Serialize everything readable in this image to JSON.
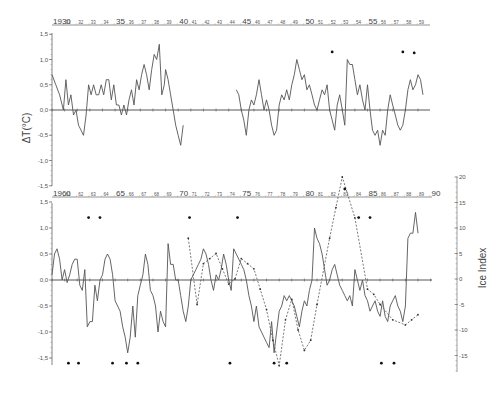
{
  "chart_data": [
    {
      "type": "line",
      "panel": "top",
      "title": "",
      "ylabel": "ΔT(°C)",
      "xlabel": "",
      "xlim": [
        1930,
        1959.9
      ],
      "ylim": [
        -1.5,
        1.5
      ],
      "yticks": [
        1.5,
        1.0,
        0.5,
        0.0,
        -0.5,
        -1.0,
        -1.5
      ],
      "ytick_labels": [
        "1,5",
        "1,0",
        "0,5",
        "0,0",
        "-0,5",
        "-1,0",
        "-1,5"
      ],
      "xtick_labels": [
        "1930",
        "31",
        "32",
        "33",
        "34",
        "35",
        "36",
        "37",
        "38",
        "39",
        "40",
        "41",
        "42",
        "43",
        "44",
        "45",
        "46",
        "47",
        "48",
        "49",
        "50",
        "51",
        "52",
        "53",
        "54",
        "55",
        "56",
        "57",
        "58",
        "59"
      ],
      "grid": false,
      "series": [
        {
          "name": "ΔT temperature anomaly",
          "style": "solid",
          "x": [
            1930.0,
            1930.3,
            1930.6,
            1930.9,
            1931.1,
            1931.3,
            1931.5,
            1931.7,
            1931.9,
            1932.1,
            1932.3,
            1932.5,
            1932.7,
            1932.9,
            1933.1,
            1933.3,
            1933.5,
            1933.7,
            1933.9,
            1934.1,
            1934.3,
            1934.5,
            1934.7,
            1934.9,
            1935.1,
            1935.3,
            1935.5,
            1935.7,
            1935.9,
            1936.1,
            1936.3,
            1936.5,
            1936.7,
            1936.9,
            1937.1,
            1937.3,
            1937.5,
            1937.7,
            1937.9,
            1938.1,
            1938.3,
            1938.5,
            1938.7,
            1938.9,
            1939.0,
            1939.2,
            1939.4,
            1939.6,
            1939.8,
            1940.0,
            1940.2,
            1940.4
          ],
          "y": [
            0.7,
            0.5,
            0.3,
            0.0,
            0.6,
            0.1,
            0.3,
            -0.1,
            0.0,
            -0.3,
            -0.4,
            -0.5,
            -0.1,
            0.5,
            0.3,
            0.5,
            0.3,
            0.3,
            0.5,
            0.3,
            0.6,
            0.6,
            0.2,
            0.5,
            0.1,
            0.1,
            -0.1,
            0.1,
            -0.1,
            0.2,
            0.4,
            0.1,
            0.6,
            0.4,
            0.7,
            0.9,
            0.7,
            0.4,
            0.8,
            1.1,
            1.0,
            1.3,
            0.3,
            0.5,
            0.8,
            0.6,
            0.3,
            0.0,
            -0.3,
            -0.5,
            -0.7,
            -0.3
          ]
        },
        {
          "name": "ΔT temperature anomaly (cont.)",
          "style": "solid",
          "x": [
            1944.6,
            1944.8,
            1945.0,
            1945.2,
            1945.4,
            1945.6,
            1945.8,
            1946.0,
            1946.2,
            1946.4,
            1946.6,
            1946.8,
            1947.0,
            1947.2,
            1947.4,
            1947.6,
            1947.8,
            1948.0,
            1948.2,
            1948.4,
            1948.6,
            1948.8,
            1949.0,
            1949.2,
            1949.4,
            1949.6,
            1949.8,
            1950.0,
            1950.2,
            1950.4,
            1950.6,
            1950.8,
            1951.0,
            1951.2,
            1951.4,
            1951.6,
            1951.8,
            1952.0,
            1952.2,
            1952.4,
            1952.6,
            1952.8,
            1953.0,
            1953.2,
            1953.4,
            1953.6,
            1953.8,
            1954.0,
            1954.2,
            1954.4,
            1954.6,
            1954.8,
            1955.0,
            1955.2,
            1955.4,
            1955.6,
            1955.8,
            1956.0,
            1956.2,
            1956.4,
            1956.6,
            1956.8,
            1957.0,
            1957.2,
            1957.4,
            1957.6,
            1957.8,
            1958.0,
            1958.2,
            1958.4,
            1958.6,
            1958.8,
            1959.0,
            1959.2,
            1959.4
          ],
          "y": [
            0.4,
            0.3,
            0.0,
            -0.2,
            -0.5,
            0.0,
            0.2,
            0.1,
            0.3,
            0.6,
            0.3,
            0.0,
            0.2,
            0.0,
            -0.3,
            -0.5,
            -0.4,
            0.1,
            0.3,
            0.2,
            0.4,
            0.2,
            0.5,
            0.7,
            1.0,
            0.8,
            0.6,
            0.7,
            0.4,
            0.5,
            0.3,
            0.1,
            0.0,
            0.2,
            0.4,
            0.3,
            0.5,
            0.0,
            -0.2,
            -0.4,
            0.1,
            0.3,
            0.0,
            -0.3,
            1.0,
            0.9,
            0.9,
            0.6,
            0.3,
            0.5,
            0.2,
            0.0,
            0.5,
            0.0,
            -0.4,
            -0.5,
            -0.4,
            -0.7,
            -0.4,
            -0.5,
            0.0,
            0.3,
            0.1,
            -0.1,
            -0.3,
            -0.4,
            -0.3,
            0.0,
            0.4,
            0.6,
            0.4,
            0.5,
            0.7,
            0.6,
            0.3
          ]
        }
      ],
      "markers": {
        "name": "event dots",
        "x": [
          1952.2,
          1957.8,
          1958.7
        ],
        "y": [
          1.15,
          1.15,
          1.13
        ]
      }
    },
    {
      "type": "line",
      "panel": "bottom",
      "title": "",
      "ylabel": "ΔT(°C)",
      "ylabel_right": "Ice Index",
      "xlabel": "",
      "xlim": [
        1960,
        1990.9
      ],
      "ylim": [
        -1.5,
        1.5
      ],
      "ylim_right": [
        -18,
        20
      ],
      "yticks": [
        1.5,
        1.0,
        0.5,
        0.0,
        -0.5,
        -1.0,
        -1.5
      ],
      "ytick_labels": [
        "1,5",
        "1,0",
        "0,5",
        "0,0",
        "-0,5",
        "-1,0",
        "-1,5"
      ],
      "yticks_right": [
        20,
        15,
        10,
        5,
        0,
        -5,
        -10,
        -15
      ],
      "xtick_labels": [
        "1960",
        "61",
        "62",
        "63",
        "64",
        "65",
        "66",
        "67",
        "68",
        "69",
        "70",
        "71",
        "72",
        "73",
        "74",
        "75",
        "76",
        "77",
        "78",
        "79",
        "80",
        "81",
        "82",
        "83",
        "84",
        "85",
        "86",
        "87",
        "88",
        "89",
        "90"
      ],
      "grid": false,
      "series": [
        {
          "name": "ΔT temperature anomaly",
          "style": "solid",
          "x": [
            1960.0,
            1960.2,
            1960.4,
            1960.6,
            1960.8,
            1961.0,
            1961.2,
            1961.4,
            1961.6,
            1961.8,
            1962.0,
            1962.2,
            1962.4,
            1962.6,
            1962.8,
            1963.0,
            1963.2,
            1963.4,
            1963.6,
            1963.8,
            1964.0,
            1964.2,
            1964.4,
            1964.6,
            1964.8,
            1965.0,
            1965.2,
            1965.4,
            1965.6,
            1965.8,
            1966.0,
            1966.2,
            1966.4,
            1966.6,
            1966.8,
            1967.0,
            1967.2,
            1967.4,
            1967.6,
            1967.8,
            1968.0,
            1968.2,
            1968.4,
            1968.6,
            1968.8,
            1969.0,
            1969.2,
            1969.4,
            1969.6,
            1969.8,
            1970.0,
            1970.2,
            1970.4,
            1970.6,
            1970.8,
            1971.0,
            1971.2,
            1971.4,
            1971.6,
            1971.8,
            1972.0,
            1972.2,
            1972.4,
            1972.6,
            1972.8,
            1973.0,
            1973.2,
            1973.4,
            1973.6,
            1973.8,
            1974.0,
            1974.2,
            1974.4,
            1974.6,
            1974.8,
            1975.0,
            1975.2,
            1975.4,
            1975.6,
            1975.8,
            1976.0,
            1976.2,
            1976.4,
            1976.6,
            1976.8,
            1977.0,
            1977.2,
            1977.4,
            1977.6,
            1977.8,
            1978.0,
            1978.2,
            1978.4,
            1978.6,
            1978.8,
            1979.0,
            1979.2,
            1979.4,
            1979.6,
            1979.8,
            1980.0,
            1980.2,
            1980.4,
            1980.6,
            1980.8,
            1981.0,
            1981.2,
            1981.4,
            1981.6,
            1981.8,
            1982.0,
            1982.2,
            1982.4,
            1982.6,
            1982.8,
            1983.0,
            1983.2,
            1983.4,
            1983.6,
            1983.8,
            1984.0,
            1984.2,
            1984.4,
            1984.6,
            1984.8,
            1985.0,
            1985.2,
            1985.4,
            1985.6,
            1985.8,
            1986.0,
            1986.2,
            1986.4,
            1986.6,
            1986.8,
            1987.0,
            1987.2,
            1987.4,
            1987.6,
            1987.8,
            1988.0,
            1988.2,
            1988.4,
            1988.6,
            1988.8,
            1989.0,
            1989.2,
            1989.4,
            1989.6,
            1989.8,
            1990.0
          ],
          "y": [
            0.1,
            0.5,
            0.6,
            0.4,
            0.0,
            0.2,
            -0.05,
            0.1,
            0.3,
            0.4,
            0.4,
            -0.1,
            -0.2,
            0.2,
            -0.9,
            -0.8,
            -0.8,
            -0.1,
            -0.4,
            0.0,
            0.1,
            0.4,
            0.5,
            0.4,
            0.1,
            -0.4,
            -0.5,
            -0.6,
            -0.9,
            -1.1,
            -1.4,
            -1.1,
            -0.5,
            -1.1,
            -0.3,
            -0.1,
            0.1,
            0.5,
            0.3,
            -0.2,
            -0.3,
            -0.5,
            -1.0,
            -0.6,
            -0.8,
            -0.9,
            0.7,
            0.3,
            0.3,
            0.0,
            0.0,
            -0.3,
            -0.6,
            -0.8,
            -0.5,
            0.0,
            0.1,
            0.2,
            0.3,
            0.4,
            0.6,
            0.5,
            0.3,
            0.0,
            -0.2,
            0.1,
            0.0,
            0.2,
            0.5,
            0.3,
            0.0,
            -0.2,
            0.6,
            0.5,
            0.4,
            0.3,
            0.2,
            0.0,
            -0.3,
            -0.5,
            -0.8,
            -0.5,
            -0.9,
            -1.0,
            -1.1,
            -1.2,
            -1.3,
            -0.8,
            -1.4,
            -1.0,
            -0.6,
            -0.5,
            -0.3,
            -0.4,
            -0.3,
            -0.4,
            -0.5,
            -0.7,
            -0.9,
            -0.6,
            -0.4,
            -0.5,
            -0.2,
            0.0,
            1.0,
            0.8,
            0.7,
            0.5,
            0.2,
            -0.1,
            0.0,
            0.2,
            0.3,
            0.1,
            -0.1,
            -0.2,
            -0.3,
            -0.4,
            -0.3,
            -0.5,
            0.2,
            0.0,
            -0.2,
            0.0,
            -0.3,
            -0.4,
            -0.6,
            -0.5,
            -0.4,
            -0.6,
            -0.7,
            -0.4,
            -0.7,
            -0.8,
            -0.5,
            -0.4,
            -0.3,
            -0.5,
            -0.6,
            -0.8,
            -0.5,
            0.8,
            0.9,
            0.9,
            1.3,
            0.9
          ]
        }
      ],
      "ice_index_series": {
        "name": "Ice Index",
        "style": "dashed",
        "axis": "right",
        "x": [
          1970.8,
          1971.5,
          1972.0,
          1972.5,
          1973.0,
          1973.5,
          1974.0,
          1974.5,
          1975.0,
          1975.5,
          1976.0,
          1976.5,
          1977.0,
          1977.5,
          1978.0,
          1978.5,
          1979.0,
          1979.5,
          1980.0,
          1980.5,
          1981.0,
          1982.0,
          1982.5,
          1983.0,
          1984.0,
          1985.0,
          1985.5,
          1986.0,
          1987.0,
          1988.0,
          1988.5,
          1989.0
        ],
        "y": [
          8,
          -5,
          3,
          4,
          5,
          2,
          -1,
          0,
          4,
          3,
          2,
          -2,
          -6,
          -12,
          -17,
          -8,
          -4,
          -10,
          -14,
          -12,
          -5,
          8,
          14,
          20,
          12,
          -2,
          -3,
          -5,
          -8,
          -9,
          -8,
          -7
        ]
      },
      "markers": {
        "name": "event dots",
        "top_row": {
          "x": [
            1962.9,
            1963.8,
            1970.9,
            1974.7,
            1984.3,
            1985.2
          ],
          "y": [
            1.2,
            1.2,
            1.2,
            1.2,
            1.2,
            1.2
          ]
        },
        "above_axis": {
          "x": [
            1983.2
          ],
          "y": [
            1.75
          ]
        },
        "bottom_row": {
          "x": [
            1961.3,
            1962.1,
            1964.8,
            1965.9,
            1966.8,
            1974.1,
            1977.6,
            1978.6,
            1986.1,
            1987.1
          ],
          "y": [
            -1.6,
            -1.6,
            -1.6,
            -1.6,
            -1.6,
            -1.6,
            -1.6,
            -1.6,
            -1.6,
            -1.6
          ]
        }
      }
    }
  ],
  "labels": {
    "top_ylabel": "ΔT(°C)",
    "right_ylabel": "Ice Index"
  }
}
